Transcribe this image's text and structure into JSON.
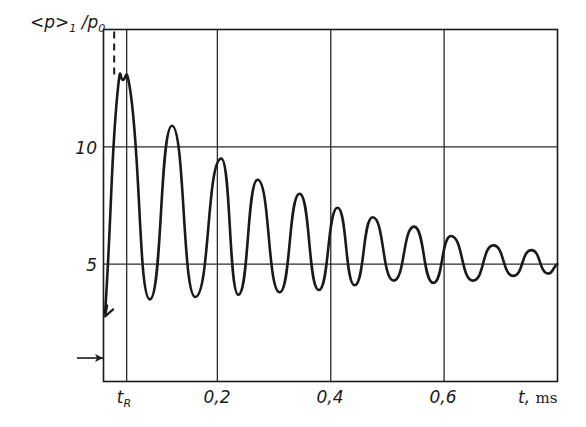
{
  "chart_data": {
    "type": "line",
    "title": "",
    "ylabel": "<p>₁ / p₀",
    "ylabel_parts": {
      "main": "<p>",
      "sub1": "1",
      "sep": " /p",
      "sub2": "0"
    },
    "xlabel": "t, ms",
    "xlabel_parts": {
      "var": "t,",
      "unit": "ms"
    },
    "xlim": [
      0,
      0.8
    ],
    "ylim": [
      0,
      15
    ],
    "grid": true,
    "x_ticks": [
      {
        "value": 0.04,
        "label": "t",
        "sub": "R"
      },
      {
        "value": 0.2,
        "label": "0,2"
      },
      {
        "value": 0.4,
        "label": "0,4"
      },
      {
        "value": 0.6,
        "label": "0,6"
      }
    ],
    "y_ticks": [
      {
        "value": 5,
        "label": "5"
      },
      {
        "value": 10,
        "label": "10"
      }
    ],
    "annotations": [
      {
        "type": "dashed-vertical-line",
        "x": 0.025,
        "y_from": 12.9,
        "y_to": 15
      },
      {
        "type": "arrow-on-axis",
        "description": "horizontal arrow pointing to y-axis",
        "y": 1.0
      },
      {
        "type": "arrow-head-on-curve",
        "description": "arrow at curve start pointing down-left",
        "x": 0.002,
        "y": 2.9
      }
    ],
    "series": [
      {
        "name": "<p>1/p0",
        "color": "#1a1a1a",
        "points": [
          {
            "x": 0.002,
            "y": 2.9
          },
          {
            "x": 0.025,
            "y": 12.6
          },
          {
            "x": 0.033,
            "y": 12.85
          },
          {
            "x": 0.045,
            "y": 12.6
          },
          {
            "x": 0.081,
            "y": 3.5
          },
          {
            "x": 0.12,
            "y": 10.9
          },
          {
            "x": 0.161,
            "y": 3.6
          },
          {
            "x": 0.207,
            "y": 9.5
          },
          {
            "x": 0.237,
            "y": 3.7
          },
          {
            "x": 0.271,
            "y": 8.6
          },
          {
            "x": 0.31,
            "y": 3.8
          },
          {
            "x": 0.345,
            "y": 8.0
          },
          {
            "x": 0.379,
            "y": 3.9
          },
          {
            "x": 0.412,
            "y": 7.4
          },
          {
            "x": 0.442,
            "y": 4.1
          },
          {
            "x": 0.474,
            "y": 7.0
          },
          {
            "x": 0.511,
            "y": 4.3
          },
          {
            "x": 0.547,
            "y": 6.6
          },
          {
            "x": 0.581,
            "y": 4.2
          },
          {
            "x": 0.612,
            "y": 6.2
          },
          {
            "x": 0.651,
            "y": 4.3
          },
          {
            "x": 0.687,
            "y": 5.8
          },
          {
            "x": 0.722,
            "y": 4.5
          },
          {
            "x": 0.754,
            "y": 5.6
          },
          {
            "x": 0.784,
            "y": 4.6
          },
          {
            "x": 0.8,
            "y": 5.0
          }
        ]
      }
    ]
  },
  "colors": {
    "ink": "#1a1a1a",
    "grid": "#2a2a2a",
    "background": "#ffffff"
  }
}
